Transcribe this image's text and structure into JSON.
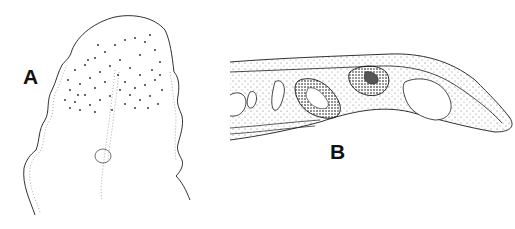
{
  "figure": {
    "panels": [
      {
        "id": "A",
        "label": "A",
        "description": "stippled anterior region outline with segmented lateral margins and central dotted line"
      },
      {
        "id": "B",
        "label": "B",
        "description": "longitudinal section showing two stippled organs, tapering posterior end with large cavity"
      }
    ],
    "colors": {
      "background": "#ffffff",
      "ink": "#1a1a1a",
      "stipple": "#333333"
    }
  }
}
